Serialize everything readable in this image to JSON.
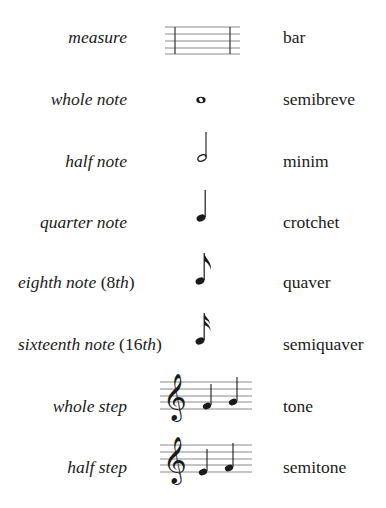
{
  "rows": [
    {
      "us_term": "measure",
      "uk_term": "bar",
      "symbol": "measure-staff"
    },
    {
      "us_term": "whole note",
      "uk_term": "semibreve",
      "symbol": "whole-note"
    },
    {
      "us_term": "half note",
      "uk_term": "minim",
      "symbol": "half-note"
    },
    {
      "us_term": "quarter note",
      "uk_term": "crotchet",
      "symbol": "quarter-note"
    },
    {
      "us_term_word": "eighth note",
      "us_term_open": " (",
      "us_term_num": "8",
      "us_term_suffix": "th",
      "us_term_close": ")",
      "uk_term": "quaver",
      "symbol": "eighth-note"
    },
    {
      "us_term_word": "sixteenth note",
      "us_term_open": " (",
      "us_term_num": "16",
      "us_term_suffix": "th",
      "us_term_close": ")",
      "uk_term": "semiquaver",
      "symbol": "sixteenth-note"
    },
    {
      "us_term": "whole step",
      "uk_term": "tone",
      "symbol": "treble-staff-f-g"
    },
    {
      "us_term": "half step",
      "uk_term": "semitone",
      "symbol": "treble-staff-e-f"
    }
  ],
  "colors": {
    "ink": "#1a1a1a",
    "staff_line": "#8a8a8a",
    "background": "#ffffff"
  }
}
